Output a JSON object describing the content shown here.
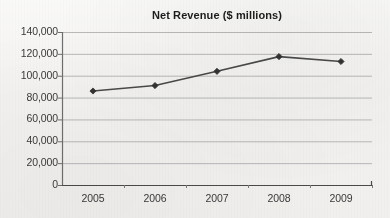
{
  "chart_data": {
    "type": "line",
    "title": "Net Revenue ($ millions)",
    "xlabel": "",
    "ylabel": "",
    "categories": [
      "2005",
      "2006",
      "2007",
      "2008",
      "2009"
    ],
    "values": [
      86000,
      91000,
      104000,
      117500,
      113000
    ],
    "series": [
      {
        "name": "Net Revenue",
        "values": [
          86000,
          91000,
          104000,
          117500,
          113000
        ]
      }
    ],
    "ylim": [
      0,
      140000
    ],
    "ytick_step": 20000,
    "ytick_labels": [
      "0",
      "20,000",
      "40,000",
      "60,000",
      "80,000",
      "100,000",
      "120,000",
      "140,000"
    ],
    "ytick_values": [
      0,
      20000,
      40000,
      60000,
      80000,
      100000,
      120000,
      140000
    ],
    "xtick_labels": [
      "2005",
      "2006",
      "2007",
      "2008",
      "2009"
    ],
    "grid": "horizontal",
    "legend": "none",
    "marker": "diamond",
    "colors": {
      "line": "#4a4a4a",
      "marker": "#333333",
      "gridline": "#b9b9b9",
      "axis": "#6e6e6e",
      "text": "#3a3a3a",
      "title": "#1d1d1d",
      "background": "#f3f2f0"
    }
  }
}
